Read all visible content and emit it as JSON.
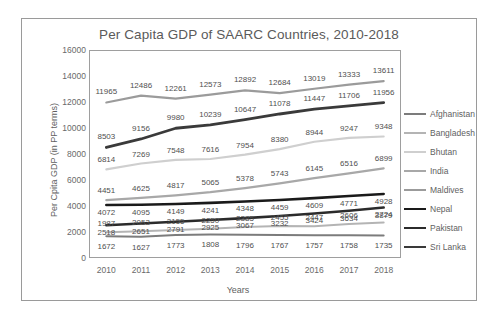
{
  "chart_data": {
    "type": "line",
    "title": "Per Capita GDP of SAARC Countries, 2010-2018",
    "xlabel": "Years",
    "ylabel": "Per Cpita GDP (in PP terms)",
    "categories": [
      "2010",
      "2011",
      "2012",
      "2013",
      "2014",
      "2015",
      "2016",
      "2017",
      "2018"
    ],
    "ylim": [
      0,
      16000
    ],
    "yticks": [
      "0",
      "2000",
      "4000",
      "6000",
      "8000",
      "10000",
      "12000",
      "14000",
      "16000"
    ],
    "grid": false,
    "legend_position": "right",
    "data_labels": true,
    "series": [
      {
        "name": "Afghanistan",
        "color": "#7c7c7c",
        "width": 2.0,
        "values": [
          1672,
          1627,
          1773,
          1808,
          1796,
          1767,
          1757,
          1758,
          1735
        ]
      },
      {
        "name": "Bangladesh",
        "color": "#b4b4b4",
        "width": 2.0,
        "values": [
          1987,
          2053,
          2155,
          2250,
          2385,
          2455,
          2447,
          2606,
          2724
        ]
      },
      {
        "name": "Bhutan",
        "color": "#cfcfcf",
        "width": 2.2,
        "values": [
          6814,
          7269,
          7548,
          7616,
          7954,
          8380,
          8944,
          9247,
          9348
        ]
      },
      {
        "name": "India",
        "color": "#a8a8a8",
        "width": 2.2,
        "values": [
          4451,
          4625,
          4817,
          5065,
          5378,
          5743,
          6145,
          6516,
          6899
        ]
      },
      {
        "name": "Maldives",
        "color": "#9b9b9b",
        "width": 2.2,
        "values": [
          11965,
          12486,
          12261,
          12573,
          12892,
          12684,
          13019,
          13333,
          13611
        ]
      },
      {
        "name": "Nepal",
        "color": "#1a1a1a",
        "width": 2.6,
        "values": [
          4072,
          4095,
          4149,
          4241,
          4348,
          4459,
          4609,
          4771,
          4928
        ]
      },
      {
        "name": "Pakistan",
        "color": "#2b2b2b",
        "width": 2.6,
        "values": [
          2518,
          2651,
          2791,
          2925,
          3067,
          3232,
          3424,
          3634,
          3879
        ]
      },
      {
        "name": "Sri Lanka",
        "color": "#3a3a3a",
        "width": 2.8,
        "values": [
          8503,
          9156,
          9980,
          10239,
          10647,
          11078,
          11447,
          11706,
          11956
        ]
      }
    ],
    "label_offsets": {
      "Afghanistan": 11,
      "Bangladesh": -8,
      "Bhutan": -9,
      "India": -9,
      "Maldives": -10,
      "Nepal": 8,
      "Pakistan": 8,
      "Sri Lanka": -10
    }
  }
}
